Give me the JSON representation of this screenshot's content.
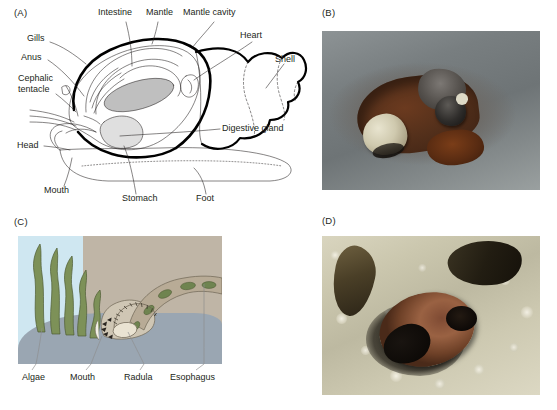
{
  "figure": {
    "panels": [
      {
        "id": "A",
        "letter": "(A)",
        "type": "line-diagram",
        "caption_internal": "Cutaway anatomical diagram of a marine snail"
      },
      {
        "id": "B",
        "letter": "(B)",
        "type": "photograph",
        "caption_internal": "Snails on a barnacle-covered intertidal rock"
      },
      {
        "id": "C",
        "letter": "(C)",
        "type": "color-illustration",
        "caption_internal": "Cutaway of snail mouth rasping algae with its radula"
      },
      {
        "id": "D",
        "letter": "(D)",
        "type": "photograph",
        "caption_internal": "Close-up of a snail shell aperture among barnacles"
      }
    ]
  },
  "panelA": {
    "letter": "(A)",
    "labels": [
      {
        "name": "gills",
        "text": "Gills",
        "x": 27,
        "y": 38
      },
      {
        "name": "intestine",
        "text": "Intestine",
        "x": 98,
        "y": 12
      },
      {
        "name": "mantle",
        "text": "Mantle",
        "x": 143,
        "y": 12
      },
      {
        "name": "mantle-cavity",
        "text": "Mantle cavity",
        "x": 182,
        "y": 12
      },
      {
        "name": "heart",
        "text": "Heart",
        "x": 240,
        "y": 34
      },
      {
        "name": "shell",
        "text": "Shell",
        "x": 272,
        "y": 56
      },
      {
        "name": "anus",
        "text": "Anus",
        "x": 25,
        "y": 56
      },
      {
        "name": "cephalic-tentacle",
        "text": "Cephalic",
        "x": 22,
        "y": 76
      },
      {
        "name": "cephalic-tentacle-2",
        "text": "tentacle",
        "x": 22,
        "y": 87
      },
      {
        "name": "digestive-gland",
        "text": "Digestive gland",
        "x": 222,
        "y": 127
      },
      {
        "name": "head",
        "text": "Head",
        "x": 20,
        "y": 143
      },
      {
        "name": "mouth",
        "text": "Mouth",
        "x": 45,
        "y": 189
      },
      {
        "name": "stomach",
        "text": "Stomach",
        "x": 124,
        "y": 197
      },
      {
        "name": "foot",
        "text": "Foot",
        "x": 196,
        "y": 197
      }
    ]
  },
  "panelB": {
    "letter": "(B)"
  },
  "panelC": {
    "letter": "(C)",
    "labels": [
      {
        "name": "algae",
        "text": "Algae",
        "x": 22,
        "y": 372
      },
      {
        "name": "mouth",
        "text": "Mouth",
        "x": 69,
        "y": 372
      },
      {
        "name": "radula",
        "text": "Radula",
        "x": 124,
        "y": 372
      },
      {
        "name": "esophagus",
        "text": "Esophagus",
        "x": 171,
        "y": 372
      }
    ],
    "colors": {
      "water": "#cfe7f1",
      "substrate_tan": "#bfb5a6",
      "rock": "#9aa6b2",
      "algae_green": "#7d9158",
      "tissue": "#cfc6b4"
    }
  },
  "panelD": {
    "letter": "(D)"
  }
}
